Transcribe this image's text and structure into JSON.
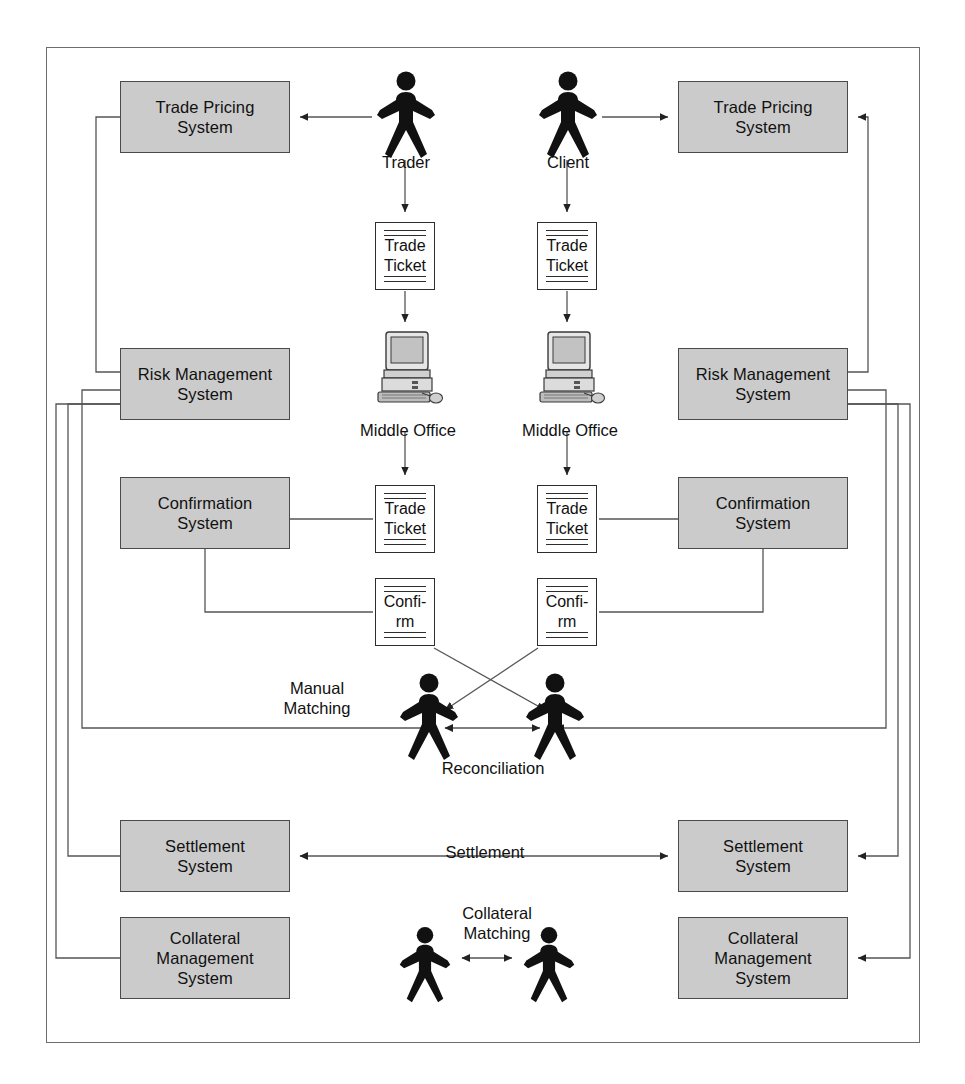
{
  "diagram": {
    "frame": {
      "name": "outer-frame"
    },
    "colors": {
      "system_box_fill": "#cbcbcb",
      "system_box_border": "#4a4a4a",
      "document_fill": "#ffffff",
      "document_border": "#2d2d2d",
      "connector": "#555555",
      "actor_fill": "#111111",
      "frame_border": "#6d6d6d",
      "background": "#ffffff"
    },
    "systems": [
      {
        "id": "trade-pricing-left",
        "label": "Trade Pricing\nSystem",
        "side": "left",
        "x": 120,
        "y": 81,
        "w": 170,
        "h": 72
      },
      {
        "id": "trade-pricing-right",
        "label": "Trade Pricing\nSystem",
        "side": "right",
        "x": 678,
        "y": 81,
        "w": 170,
        "h": 72
      },
      {
        "id": "risk-management-left",
        "label": "Risk Management\nSystem",
        "side": "left",
        "x": 120,
        "y": 348,
        "w": 170,
        "h": 72
      },
      {
        "id": "risk-management-right",
        "label": "Risk Management\nSystem",
        "side": "right",
        "x": 678,
        "y": 348,
        "w": 170,
        "h": 72
      },
      {
        "id": "confirmation-left",
        "label": "Confirmation\nSystem",
        "side": "left",
        "x": 120,
        "y": 477,
        "w": 170,
        "h": 72
      },
      {
        "id": "confirmation-right",
        "label": "Confirmation\nSystem",
        "side": "right",
        "x": 678,
        "y": 477,
        "w": 170,
        "h": 72
      },
      {
        "id": "settlement-left",
        "label": "Settlement\nSystem",
        "side": "left",
        "x": 120,
        "y": 820,
        "w": 170,
        "h": 72
      },
      {
        "id": "settlement-right",
        "label": "Settlement\nSystem",
        "side": "right",
        "x": 678,
        "y": 820,
        "w": 170,
        "h": 72
      },
      {
        "id": "collateral-left",
        "label": "Collateral\nManagement\nSystem",
        "side": "left",
        "x": 120,
        "y": 917,
        "w": 170,
        "h": 82
      },
      {
        "id": "collateral-right",
        "label": "Collateral\nManagement\nSystem",
        "side": "right",
        "x": 678,
        "y": 917,
        "w": 170,
        "h": 82
      }
    ],
    "documents": [
      {
        "id": "trade-ticket-trader-top",
        "label": "Trade\nTicket",
        "x": 375,
        "y": 222,
        "w": 60,
        "h": 68
      },
      {
        "id": "trade-ticket-client-top",
        "label": "Trade\nTicket",
        "x": 537,
        "y": 222,
        "w": 60,
        "h": 68
      },
      {
        "id": "trade-ticket-trader-mid",
        "label": "Trade\nTicket",
        "x": 375,
        "y": 485,
        "w": 60,
        "h": 68
      },
      {
        "id": "trade-ticket-client-mid",
        "label": "Trade\nTicket",
        "x": 537,
        "y": 485,
        "w": 60,
        "h": 68
      },
      {
        "id": "confirm-trader",
        "label": "Confi-\nrm",
        "x": 375,
        "y": 578,
        "w": 60,
        "h": 68
      },
      {
        "id": "confirm-client",
        "label": "Confi-\nrm",
        "x": 537,
        "y": 578,
        "w": 60,
        "h": 68
      }
    ],
    "actors": [
      {
        "id": "actor-trader",
        "label": "Trader",
        "x": 375,
        "y": 70,
        "w": 62,
        "h": 88,
        "label_y": 152
      },
      {
        "id": "actor-client",
        "label": "Client",
        "x": 537,
        "y": 70,
        "w": 62,
        "h": 88,
        "label_y": 152
      },
      {
        "id": "actor-reconciliation-left",
        "label": "",
        "x": 398,
        "y": 672,
        "w": 62,
        "h": 88,
        "label_y": 0
      },
      {
        "id": "actor-reconciliation-right",
        "label": "",
        "x": 524,
        "y": 672,
        "w": 62,
        "h": 88,
        "label_y": 0
      },
      {
        "id": "actor-collateral-left",
        "label": "",
        "x": 398,
        "y": 924,
        "w": 54,
        "h": 80,
        "label_y": 0
      },
      {
        "id": "actor-collateral-right",
        "label": "",
        "x": 522,
        "y": 924,
        "w": 54,
        "h": 80,
        "label_y": 0
      }
    ],
    "workstations": [
      {
        "id": "middle-office-trader",
        "label": "Middle Office",
        "x": 372,
        "y": 330,
        "w": 72,
        "h": 82,
        "label_y": 420
      },
      {
        "id": "middle-office-client",
        "label": "Middle Office",
        "x": 534,
        "y": 330,
        "w": 72,
        "h": 82,
        "label_y": 420
      }
    ],
    "flow_labels": [
      {
        "id": "label-manual-matching",
        "text": "Manual\nMatching",
        "x": 262,
        "y": 678,
        "w": 110
      },
      {
        "id": "label-reconciliation",
        "text": "Reconciliation",
        "x": 418,
        "y": 758,
        "w": 150
      },
      {
        "id": "label-settlement",
        "text": "Settlement",
        "x": 425,
        "y": 842,
        "w": 120
      },
      {
        "id": "label-collateral-matching",
        "text": "Collateral\nMatching",
        "x": 432,
        "y": 903,
        "w": 130
      }
    ],
    "actor_labels": [
      {
        "id": "label-trader",
        "text": "Trader",
        "x": 376,
        "y": 152,
        "w": 60
      },
      {
        "id": "label-client",
        "text": "Client",
        "x": 538,
        "y": 152,
        "w": 60
      },
      {
        "id": "label-middle-office-left",
        "text": "Middle Office",
        "x": 340,
        "y": 420,
        "w": 136
      },
      {
        "id": "label-middle-office-right",
        "text": "Middle Office",
        "x": 502,
        "y": 420,
        "w": 136
      }
    ]
  }
}
